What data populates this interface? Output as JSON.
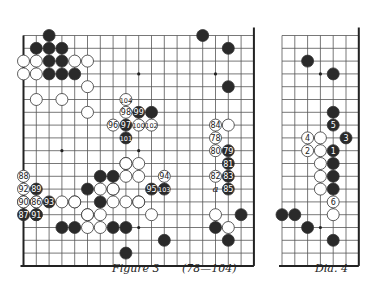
{
  "figure3": {
    "caption": "Figure  3",
    "range": "(78—104)",
    "cols": 19,
    "rows": 19,
    "x0": 23.5,
    "y0": 35.5,
    "step": 12.8,
    "stars": [
      [
        3,
        3
      ],
      [
        9,
        3
      ],
      [
        15,
        3
      ],
      [
        3,
        9
      ],
      [
        9,
        9
      ],
      [
        15,
        9
      ],
      [
        3,
        15
      ],
      [
        9,
        15
      ],
      [
        15,
        15
      ]
    ],
    "black": [
      [
        2,
        0
      ],
      [
        1,
        1
      ],
      [
        2,
        1
      ],
      [
        3,
        1
      ],
      [
        2,
        2
      ],
      [
        3,
        2
      ],
      [
        3,
        3
      ],
      [
        4,
        3
      ],
      [
        2,
        3
      ],
      [
        14,
        0
      ],
      [
        16,
        1
      ],
      [
        16,
        4
      ],
      [
        10,
        6
      ],
      [
        8,
        10
      ],
      [
        7,
        11
      ],
      [
        6,
        11
      ],
      [
        5,
        12
      ],
      [
        6,
        13
      ],
      [
        7,
        12
      ],
      [
        4,
        13
      ],
      [
        5,
        14
      ],
      [
        4,
        15
      ],
      [
        1,
        14
      ],
      [
        3,
        15
      ],
      [
        9,
        13
      ],
      [
        7,
        15
      ],
      [
        8,
        15
      ],
      [
        16,
        16
      ],
      [
        17,
        14
      ],
      [
        15,
        15
      ],
      [
        8,
        17
      ],
      [
        11,
        16
      ]
    ],
    "white": [
      [
        0,
        2
      ],
      [
        1,
        2
      ],
      [
        0,
        3
      ],
      [
        1,
        3
      ],
      [
        4,
        2
      ],
      [
        5,
        2
      ],
      [
        5,
        4
      ],
      [
        3,
        5
      ],
      [
        1,
        5
      ],
      [
        5,
        6
      ],
      [
        0,
        13
      ],
      [
        1,
        13
      ],
      [
        3,
        13
      ],
      [
        4,
        13
      ],
      [
        8,
        10
      ],
      [
        9,
        10
      ],
      [
        9,
        11
      ],
      [
        8,
        11
      ],
      [
        6,
        12
      ],
      [
        7,
        12
      ],
      [
        5,
        14
      ],
      [
        6,
        14
      ],
      [
        5,
        15
      ],
      [
        6,
        15
      ],
      [
        7,
        13
      ],
      [
        8,
        13
      ],
      [
        9,
        13
      ],
      [
        10,
        14
      ],
      [
        16,
        7
      ],
      [
        15,
        14
      ],
      [
        16,
        15
      ]
    ],
    "numbered": [
      {
        "n": "104",
        "c": "w",
        "x": 8,
        "y": 5
      },
      {
        "n": "98",
        "c": "w",
        "x": 8,
        "y": 6
      },
      {
        "n": "99",
        "c": "b",
        "x": 9,
        "y": 6
      },
      {
        "n": "96",
        "c": "w",
        "x": 7,
        "y": 7
      },
      {
        "n": "97",
        "c": "b",
        "x": 8,
        "y": 7
      },
      {
        "n": "100",
        "c": "w",
        "x": 9,
        "y": 7
      },
      {
        "n": "102",
        "c": "w",
        "x": 10,
        "y": 7
      },
      {
        "n": "101",
        "c": "b",
        "x": 8,
        "y": 8
      },
      {
        "n": "84",
        "c": "w",
        "x": 15,
        "y": 7
      },
      {
        "n": "78",
        "c": "w",
        "x": 15,
        "y": 8
      },
      {
        "n": "79",
        "c": "b",
        "x": 16,
        "y": 9
      },
      {
        "n": "80",
        "c": "w",
        "x": 15,
        "y": 9
      },
      {
        "n": "81",
        "c": "b",
        "x": 16,
        "y": 10
      },
      {
        "n": "82",
        "c": "w",
        "x": 15,
        "y": 11
      },
      {
        "n": "83",
        "c": "b",
        "x": 16,
        "y": 11
      },
      {
        "n": "85",
        "c": "b",
        "x": 16,
        "y": 12
      },
      {
        "n": "94",
        "c": "w",
        "x": 11,
        "y": 11
      },
      {
        "n": "95",
        "c": "b",
        "x": 10,
        "y": 12
      },
      {
        "n": "103",
        "c": "b",
        "x": 11,
        "y": 12
      },
      {
        "n": "88",
        "c": "w",
        "x": 0,
        "y": 11
      },
      {
        "n": "92",
        "c": "w",
        "x": 0,
        "y": 12
      },
      {
        "n": "89",
        "c": "b",
        "x": 1,
        "y": 12
      },
      {
        "n": "90",
        "c": "w",
        "x": 0,
        "y": 13
      },
      {
        "n": "86",
        "c": "w",
        "x": 1,
        "y": 13
      },
      {
        "n": "93",
        "c": "b",
        "x": 2,
        "y": 13
      },
      {
        "n": "87",
        "c": "b",
        "x": 0,
        "y": 14
      },
      {
        "n": "91",
        "c": "b",
        "x": 1,
        "y": 14
      }
    ],
    "labels": [
      {
        "t": "a",
        "x": 15,
        "y": 12
      }
    ]
  },
  "dia4": {
    "caption": "Dia.  4",
    "cols": 7,
    "rows": 19,
    "x0": 282,
    "y0": 35.5,
    "step": 12.8,
    "stars": [
      [
        3,
        3
      ],
      [
        3,
        9
      ],
      [
        3,
        15
      ]
    ],
    "black": [
      [
        2,
        2
      ],
      [
        4,
        3
      ],
      [
        4,
        6
      ],
      [
        4,
        10
      ],
      [
        4,
        11
      ],
      [
        4,
        12
      ],
      [
        0,
        14
      ],
      [
        1,
        14
      ],
      [
        2,
        15
      ],
      [
        4,
        16
      ]
    ],
    "white": [
      [
        3,
        8
      ],
      [
        3,
        9
      ],
      [
        3,
        10
      ],
      [
        3,
        11
      ],
      [
        3,
        12
      ],
      [
        4,
        14
      ]
    ],
    "numbered": [
      {
        "n": "5",
        "c": "b",
        "x": 4,
        "y": 7
      },
      {
        "n": "4",
        "c": "w",
        "x": 2,
        "y": 8
      },
      {
        "n": "3",
        "c": "b",
        "x": 5,
        "y": 8
      },
      {
        "n": "2",
        "c": "w",
        "x": 2,
        "y": 9
      },
      {
        "n": "1",
        "c": "b",
        "x": 4,
        "y": 9
      },
      {
        "n": "6",
        "c": "w",
        "x": 4,
        "y": 13
      }
    ]
  }
}
